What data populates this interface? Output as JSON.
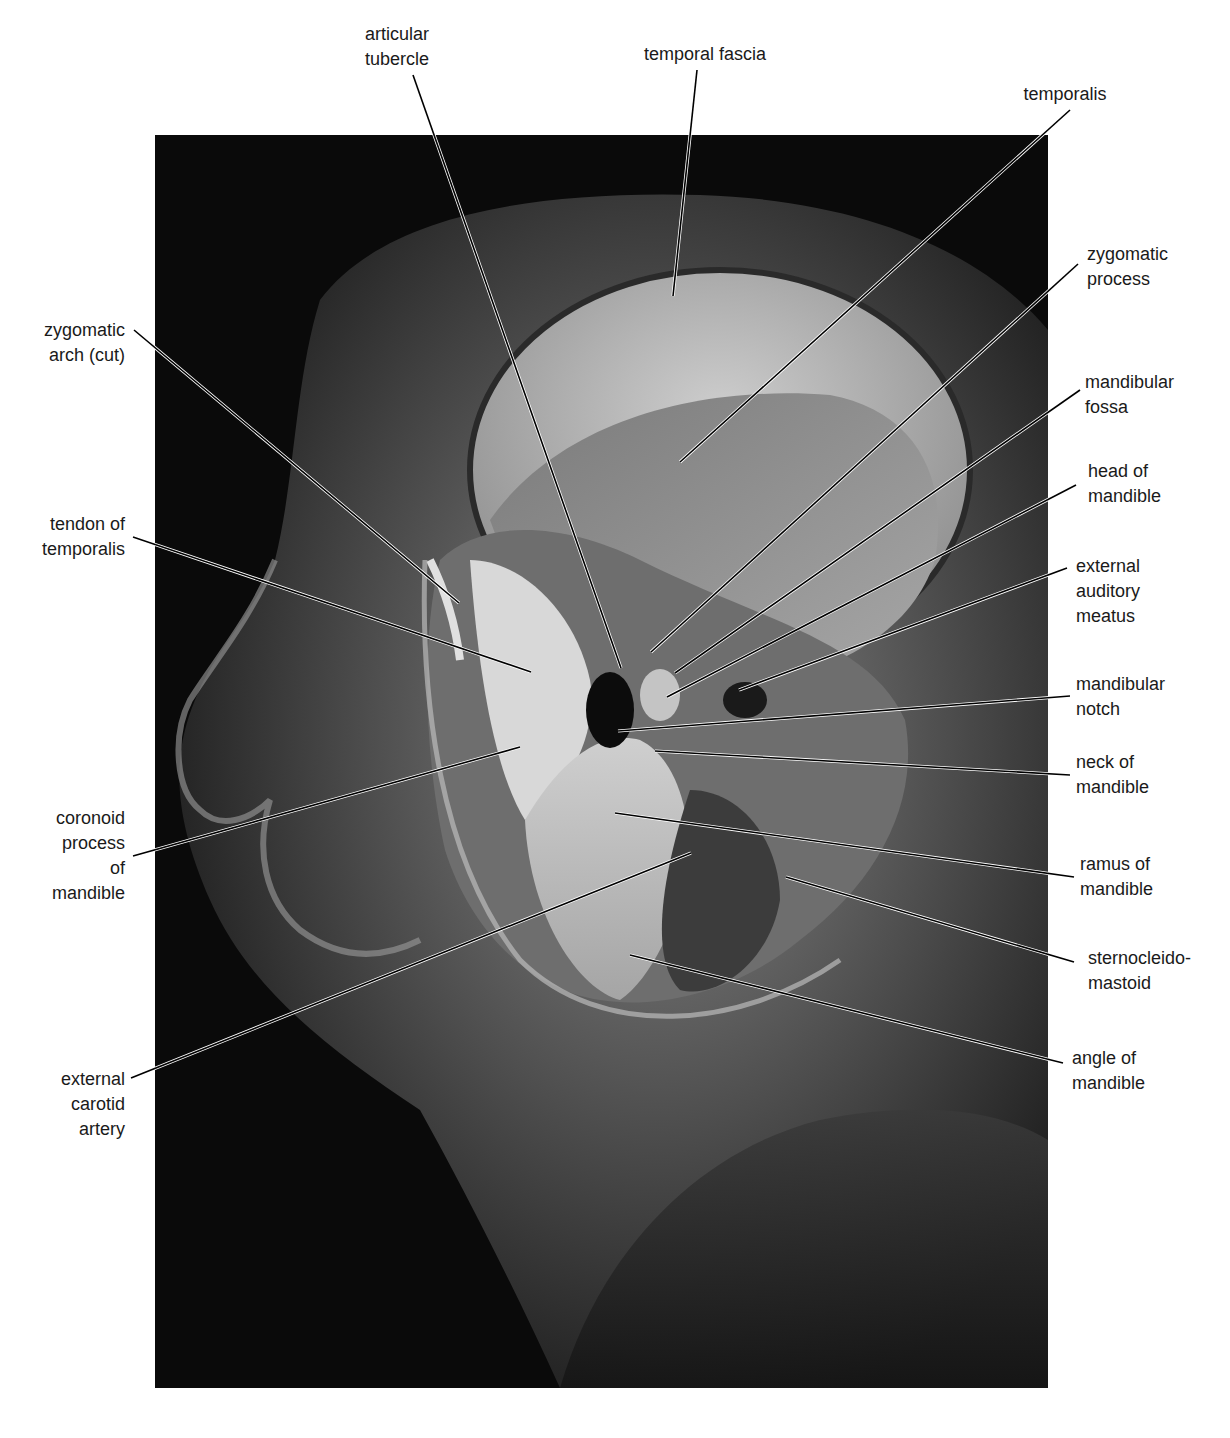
{
  "figure": {
    "photo": {
      "x": 155,
      "y": 135,
      "width": 893,
      "height": 1253
    },
    "colors": {
      "background": "#ffffff",
      "photo_base": "#0a0a0a",
      "leader_line": "#000000",
      "text": "#1a1a1a"
    }
  },
  "labels": [
    {
      "id": "articular-tubercle",
      "text": "articular\ntubercle",
      "x": 397,
      "y": 22,
      "align": "center",
      "line": [
        [
          413,
          75
        ],
        [
          621,
          668
        ]
      ]
    },
    {
      "id": "temporal-fascia",
      "text": "temporal fascia",
      "x": 705,
      "y": 42,
      "align": "center",
      "line": [
        [
          697,
          70
        ],
        [
          673,
          296
        ]
      ]
    },
    {
      "id": "temporalis",
      "text": "temporalis",
      "x": 1065,
      "y": 82,
      "align": "center",
      "line": [
        [
          1070,
          110
        ],
        [
          680,
          462
        ]
      ]
    },
    {
      "id": "zygomatic-process",
      "text": "zygomatic\nprocess",
      "x": 1087,
      "y": 242,
      "align": "right",
      "line": [
        [
          1078,
          264
        ],
        [
          651,
          652
        ]
      ]
    },
    {
      "id": "mandibular-fossa",
      "text": "mandibular\nfossa",
      "x": 1085,
      "y": 370,
      "align": "right",
      "line": [
        [
          1080,
          390
        ],
        [
          675,
          673
        ]
      ]
    },
    {
      "id": "head-of-mandible",
      "text": "head of\nmandible",
      "x": 1088,
      "y": 459,
      "align": "right",
      "line": [
        [
          1076,
          485
        ],
        [
          667,
          697
        ]
      ]
    },
    {
      "id": "external-auditory-meatus",
      "text": "external\nauditory\nmeatus",
      "x": 1076,
      "y": 554,
      "align": "right",
      "line": [
        [
          1067,
          568
        ],
        [
          739,
          690
        ]
      ]
    },
    {
      "id": "mandibular-notch",
      "text": "mandibular\nnotch",
      "x": 1076,
      "y": 672,
      "align": "right",
      "line": [
        [
          1070,
          696
        ],
        [
          618,
          731
        ]
      ]
    },
    {
      "id": "neck-of-mandible",
      "text": "neck of\nmandible",
      "x": 1076,
      "y": 750,
      "align": "right",
      "line": [
        [
          1070,
          775
        ],
        [
          655,
          751
        ]
      ]
    },
    {
      "id": "ramus-of-mandible",
      "text": "ramus of\nmandible",
      "x": 1080,
      "y": 852,
      "align": "right",
      "line": [
        [
          1074,
          877
        ],
        [
          615,
          813
        ]
      ]
    },
    {
      "id": "sternocleidomastoid",
      "text": "sternocleido-\nmastoid",
      "x": 1088,
      "y": 946,
      "align": "right",
      "line": [
        [
          1074,
          962
        ],
        [
          786,
          877
        ]
      ]
    },
    {
      "id": "angle-of-mandible",
      "text": "angle of\nmandible",
      "x": 1072,
      "y": 1046,
      "align": "right",
      "line": [
        [
          1063,
          1063
        ],
        [
          630,
          955
        ]
      ]
    },
    {
      "id": "zygomatic-arch-cut",
      "text": "zygomatic\narch (cut)",
      "x": 30,
      "y": 318,
      "align": "left",
      "line": [
        [
          134,
          330
        ],
        [
          459,
          603
        ]
      ]
    },
    {
      "id": "tendon-of-temporalis",
      "text": "tendon of\ntemporalis",
      "x": 30,
      "y": 512,
      "align": "left",
      "line": [
        [
          133,
          537
        ],
        [
          531,
          672
        ]
      ]
    },
    {
      "id": "coronoid-process-of-mandible",
      "text": "coronoid\nprocess\nof\nmandible",
      "x": 30,
      "y": 806,
      "align": "left",
      "line": [
        [
          133,
          856
        ],
        [
          520,
          747
        ]
      ]
    },
    {
      "id": "external-carotid-artery",
      "text": "external\ncarotid\nartery",
      "x": 30,
      "y": 1067,
      "align": "left",
      "line": [
        [
          131,
          1078
        ],
        [
          691,
          853
        ]
      ]
    }
  ]
}
